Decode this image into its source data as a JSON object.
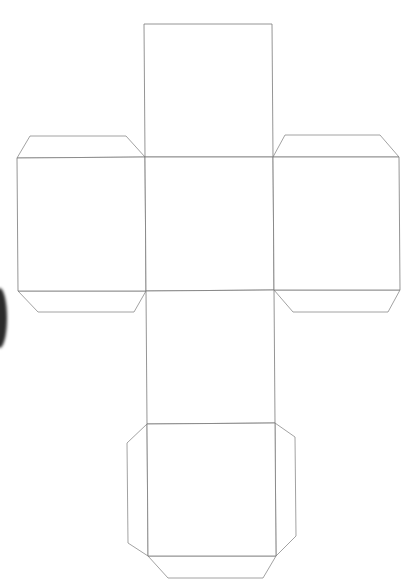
{
  "diagram": {
    "stroke_color": "#7a7a7a",
    "background": "#ffffff",
    "faces": [
      {
        "name": "top-face",
        "points": "144,24 272,24 273,157 145,157"
      },
      {
        "name": "left-face",
        "points": "17,158 145,157 146,291 18,291"
      },
      {
        "name": "center-face",
        "points": "145,157 273,157 274,290 146,291"
      },
      {
        "name": "right-face",
        "points": "273,157 399,157 400,290 274,290"
      },
      {
        "name": "lower-middle-face",
        "points": "146,291 274,290 275,423 147,424"
      },
      {
        "name": "bottom-face",
        "points": "147,424 275,423 276,556 148,556"
      }
    ],
    "tabs": [
      {
        "name": "left-face-top-tab",
        "points": "17,158 30,136 126,136 145,157"
      },
      {
        "name": "left-face-bottom-tab",
        "points": "18,291 38,312 134,312 146,291"
      },
      {
        "name": "right-face-top-tab",
        "points": "273,157 285,135 380,135 399,157"
      },
      {
        "name": "right-face-bottom-tab",
        "points": "274,290 293,312 388,312 400,290"
      },
      {
        "name": "bottom-face-left-tab",
        "points": "147,424 127,443 128,543 148,556"
      },
      {
        "name": "bottom-face-right-tab",
        "points": "275,423 295,437 296,536 276,556"
      },
      {
        "name": "bottom-face-bottom-tab",
        "points": "148,556 168,578 263,578 276,556"
      }
    ],
    "artifact": "dark-smudge-left-edge"
  }
}
